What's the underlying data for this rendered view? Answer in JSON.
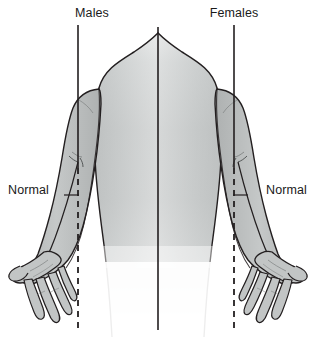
{
  "figure": {
    "width": 315,
    "height": 337,
    "background_color": "#ffffff"
  },
  "labels": {
    "males": "Males",
    "females": "Females",
    "normal_left": "Normal",
    "normal_right": "Normal"
  },
  "colors": {
    "skin_fill": "#b9bcbc",
    "skin_fill_light": "#c6c9c9",
    "outline": "#231f20",
    "torso_gradient_top": "#f2f3f3",
    "torso_gradient_mid": "#c3c6c6",
    "torso_gradient_bottom": "#ffffff",
    "reference_line": "#231f20",
    "dashed_line": "#231f20",
    "text": "#1a1a1a"
  },
  "reference_lines": {
    "left_vertical": {
      "name": "males-reference-line",
      "x": 78,
      "y_top": 25,
      "y_solid_end": 168,
      "y_dash_end": 330,
      "style_upper": "solid",
      "style_lower": "dashed"
    },
    "center_vertical": {
      "name": "midline",
      "x": 158,
      "y_top": 27,
      "y_bottom": 330,
      "style": "solid"
    },
    "right_vertical": {
      "name": "females-reference-line",
      "x": 234,
      "y_top": 25,
      "y_solid_end": 168,
      "y_dash_end": 330,
      "style_upper": "solid",
      "style_lower": "dashed"
    }
  },
  "label_positions": {
    "males": {
      "x": 92,
      "y": 17
    },
    "females": {
      "x": 234,
      "y": 17
    },
    "normal_left": {
      "x": 8,
      "y": 194
    },
    "normal_right": {
      "x": 307,
      "y": 194
    }
  },
  "annotations": {
    "carrying_angle_tick_left": {
      "x1": 64,
      "y1": 195,
      "x2": 80,
      "y2": 195
    },
    "carrying_angle_tick_right": {
      "x1": 232,
      "y1": 195,
      "x2": 248,
      "y2": 195
    }
  }
}
